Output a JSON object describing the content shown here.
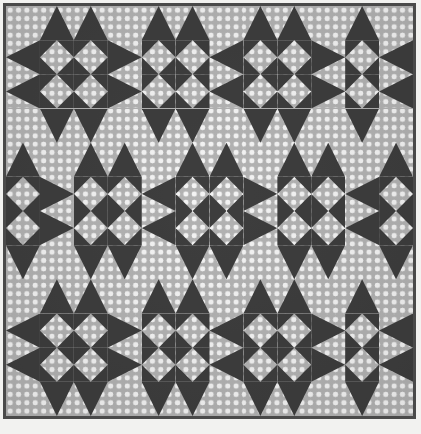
{
  "image": {
    "kind": "photograph",
    "subject": "patchwork quilt top",
    "width": 421,
    "height": 434,
    "caption": "",
    "background_color": "#f2f2f0"
  },
  "frame": {
    "border_color": "#4a4a4a",
    "border_width": 3
  },
  "palette": {
    "dark_solid": "#3d3d3d",
    "dot_fabric_ground": "#b3b3b3",
    "dot_color": "#f4f4f4",
    "paper_white": "#f2f2f0"
  },
  "quilt": {
    "block_name": "Sawtooth Star",
    "set": "alternating / interlocking",
    "grid_units_across": 12,
    "grid_units_down": 12,
    "unit_width_px": 33.92,
    "unit_height_px": 34.17,
    "dot_pitch_px": 8.35,
    "dot_radius_px": 2.45,
    "fabrics": [
      {
        "name": "dark solid",
        "color": "#3d3d3d"
      },
      {
        "name": "grey polka dot",
        "color": "#b3b3b3",
        "dot_color": "#f4f4f4"
      }
    ],
    "cells": [
      [
        "plain",
        "geese-down",
        "geese-down",
        "plain",
        "geese-down",
        "geese-down",
        "plain",
        "geese-down",
        "geese-down",
        "plain",
        "geese-down",
        "plain"
      ],
      [
        "geese-right",
        "onpoint",
        "onpoint",
        "geese-left",
        "onpoint",
        "onpoint",
        "geese-right",
        "onpoint",
        "onpoint",
        "geese-left",
        "onpoint",
        "geese-right"
      ],
      [
        "geese-right",
        "onpoint",
        "onpoint",
        "geese-left",
        "onpoint",
        "onpoint",
        "geese-right",
        "onpoint",
        "onpoint",
        "geese-left",
        "onpoint",
        "geese-right"
      ],
      [
        "plain",
        "geese-up",
        "geese-up",
        "plain",
        "geese-up",
        "geese-up",
        "plain",
        "geese-up",
        "geese-up",
        "plain",
        "geese-up",
        "plain"
      ],
      [
        "geese-down",
        "plain",
        "geese-down",
        "geese-down",
        "plain",
        "geese-down",
        "geese-down",
        "plain",
        "geese-down",
        "geese-down",
        "plain",
        "geese-down"
      ],
      [
        "onpoint",
        "geese-left",
        "onpoint",
        "onpoint",
        "geese-right",
        "onpoint",
        "onpoint",
        "geese-left",
        "onpoint",
        "onpoint",
        "geese-right",
        "onpoint"
      ],
      [
        "onpoint",
        "geese-left",
        "onpoint",
        "onpoint",
        "geese-right",
        "onpoint",
        "onpoint",
        "geese-left",
        "onpoint",
        "onpoint",
        "geese-right",
        "onpoint"
      ],
      [
        "geese-up",
        "plain",
        "geese-up",
        "geese-up",
        "plain",
        "geese-up",
        "geese-up",
        "plain",
        "geese-up",
        "geese-up",
        "plain",
        "geese-up"
      ],
      [
        "plain",
        "geese-down",
        "geese-down",
        "plain",
        "geese-down",
        "geese-down",
        "plain",
        "geese-down",
        "geese-down",
        "plain",
        "geese-down",
        "plain"
      ],
      [
        "geese-right",
        "onpoint",
        "onpoint",
        "geese-left",
        "onpoint",
        "onpoint",
        "geese-right",
        "onpoint",
        "onpoint",
        "geese-left",
        "onpoint",
        "geese-right"
      ],
      [
        "geese-right",
        "onpoint",
        "onpoint",
        "geese-left",
        "onpoint",
        "onpoint",
        "geese-right",
        "onpoint",
        "onpoint",
        "geese-left",
        "onpoint",
        "geese-right"
      ],
      [
        "plain",
        "geese-up",
        "geese-up",
        "plain",
        "geese-up",
        "geese-up",
        "plain",
        "geese-up",
        "geese-up",
        "plain",
        "geese-up",
        "plain"
      ]
    ]
  }
}
